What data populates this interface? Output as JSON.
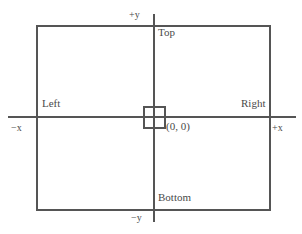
{
  "diagram": {
    "stroke_color": "#555555",
    "text_color": "#4a4a4a",
    "background_color": "#ffffff",
    "axes": {
      "x_positive_label": "+x",
      "x_negative_label": "−x",
      "y_positive_label": "+y",
      "y_negative_label": "−y"
    },
    "edges": {
      "top_label": "Top",
      "bottom_label": "Bottom",
      "left_label": "Left",
      "right_label": "Right"
    },
    "origin": {
      "label": "(0, 0)",
      "marker": "square"
    }
  }
}
